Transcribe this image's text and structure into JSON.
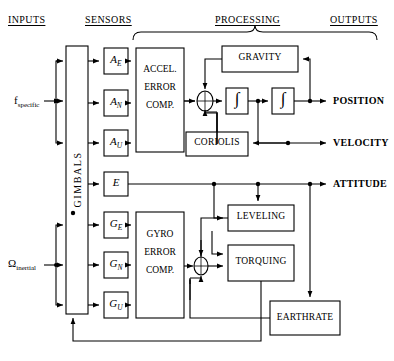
{
  "diagram": {
    "columns": [
      {
        "id": "inputs",
        "label": "INPUTS",
        "x": 8,
        "y": 14
      },
      {
        "id": "sensors",
        "label": "SENSORS",
        "x": 85,
        "y": 14
      },
      {
        "id": "processing",
        "label": "PROCESSING",
        "x": 215,
        "y": 14
      },
      {
        "id": "outputs",
        "label": "OUTPUTS",
        "x": 330,
        "y": 14
      }
    ],
    "inputs": [
      {
        "id": "f-specific",
        "base": "f",
        "sub": "specific",
        "x": 10,
        "y": 94
      },
      {
        "id": "omega-inertial",
        "base": "Ω",
        "sub": "inertial",
        "x": 6,
        "y": 256
      }
    ],
    "gimbals": {
      "label": "GIMBALS",
      "x": 66,
      "y": 46,
      "w": 22,
      "h": 268
    },
    "sensors": [
      {
        "id": "accel-east",
        "base": "A",
        "sub": "E",
        "x": 104,
        "y": 48,
        "w": 24,
        "h": 26
      },
      {
        "id": "accel-north",
        "base": "A",
        "sub": "N",
        "x": 104,
        "y": 90,
        "w": 24,
        "h": 26
      },
      {
        "id": "accel-up",
        "base": "A",
        "sub": "U",
        "x": 104,
        "y": 130,
        "w": 24,
        "h": 26
      },
      {
        "id": "e-box",
        "base": "E",
        "sub": "",
        "x": 104,
        "y": 172,
        "w": 24,
        "h": 24
      },
      {
        "id": "gyro-east",
        "base": "G",
        "sub": "E",
        "x": 104,
        "y": 212,
        "w": 24,
        "h": 26
      },
      {
        "id": "gyro-north",
        "base": "G",
        "sub": "N",
        "x": 104,
        "y": 252,
        "w": 24,
        "h": 26
      },
      {
        "id": "gyro-up",
        "base": "G",
        "sub": "U",
        "x": 104,
        "y": 292,
        "w": 24,
        "h": 26
      }
    ],
    "processing_blocks": [
      {
        "id": "accel-error-comp",
        "lines": [
          "ACCEL.",
          "ERROR",
          "COMP."
        ],
        "x": 136,
        "y": 48,
        "w": 48,
        "h": 104
      },
      {
        "id": "gyro-error-comp",
        "lines": [
          "GYRO",
          "ERROR",
          "COMP."
        ],
        "x": 136,
        "y": 212,
        "w": 48,
        "h": 106
      },
      {
        "id": "gravity",
        "lines": [
          "GRAVITY"
        ],
        "x": 222,
        "y": 46,
        "w": 76,
        "h": 26
      },
      {
        "id": "coriolis",
        "lines": [
          "CORIOLIS"
        ],
        "x": 186,
        "y": 132,
        "w": 62,
        "h": 24
      },
      {
        "id": "leveling",
        "lines": [
          "LEVELING"
        ],
        "x": 228,
        "y": 205,
        "w": 66,
        "h": 26
      },
      {
        "id": "torquing",
        "lines": [
          "TORQUING"
        ],
        "x": 228,
        "y": 245,
        "w": 66,
        "h": 36
      },
      {
        "id": "earthrate",
        "lines": [
          "EARTHRATE"
        ],
        "x": 270,
        "y": 301,
        "w": 70,
        "h": 34
      },
      {
        "id": "integrator-1",
        "lines": [
          "∫"
        ],
        "x": 226,
        "y": 88,
        "w": 22,
        "h": 26
      },
      {
        "id": "integrator-2",
        "lines": [
          "∫"
        ],
        "x": 272,
        "y": 88,
        "w": 22,
        "h": 26
      }
    ],
    "summing_junctions": [
      {
        "id": "accel-sum",
        "cx": 205,
        "cy": 101,
        "rx": 8,
        "ry": 10
      },
      {
        "id": "gyro-sum",
        "cx": 201,
        "cy": 266,
        "rx": 7,
        "ry": 9
      }
    ],
    "outputs": [
      {
        "id": "position",
        "label": "POSITION",
        "x": 333,
        "y": 94
      },
      {
        "id": "velocity",
        "label": "VELOCITY",
        "x": 333,
        "y": 136
      },
      {
        "id": "attitude",
        "label": "ATTITUDE",
        "x": 333,
        "y": 178
      }
    ],
    "colors": {
      "stroke": "#000000",
      "background": "#ffffff",
      "text": "#000000"
    }
  }
}
